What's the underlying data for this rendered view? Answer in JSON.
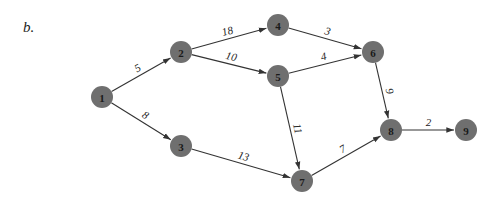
{
  "panel_label": "b.",
  "graph": {
    "node_color": "#6f6f6f",
    "edge_color": "#333333",
    "nodes": [
      {
        "id": "1",
        "x": 102,
        "y": 97
      },
      {
        "id": "2",
        "x": 181,
        "y": 52
      },
      {
        "id": "3",
        "x": 181,
        "y": 146
      },
      {
        "id": "4",
        "x": 278,
        "y": 25
      },
      {
        "id": "5",
        "x": 278,
        "y": 76
      },
      {
        "id": "6",
        "x": 373,
        "y": 52
      },
      {
        "id": "7",
        "x": 302,
        "y": 181
      },
      {
        "id": "8",
        "x": 391,
        "y": 130
      },
      {
        "id": "9",
        "x": 466,
        "y": 130
      }
    ],
    "edges": [
      {
        "from": "1",
        "to": "2",
        "weight": "5"
      },
      {
        "from": "1",
        "to": "3",
        "weight": "8"
      },
      {
        "from": "2",
        "to": "4",
        "weight": "18"
      },
      {
        "from": "2",
        "to": "5",
        "weight": "10"
      },
      {
        "from": "3",
        "to": "7",
        "weight": "13"
      },
      {
        "from": "4",
        "to": "6",
        "weight": "3"
      },
      {
        "from": "5",
        "to": "6",
        "weight": "4"
      },
      {
        "from": "5",
        "to": "7",
        "weight": "11"
      },
      {
        "from": "6",
        "to": "8",
        "weight": "9"
      },
      {
        "from": "7",
        "to": "8",
        "weight": "7"
      },
      {
        "from": "8",
        "to": "9",
        "weight": "2"
      }
    ]
  }
}
